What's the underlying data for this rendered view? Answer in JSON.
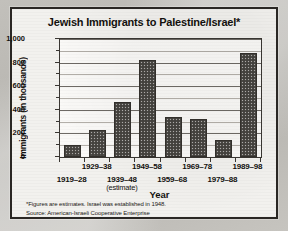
{
  "chart_data": {
    "type": "bar",
    "title": "Jewish Immigrants to Palestine/Israel*",
    "xlabel": "Year",
    "ylabel": "Immigrants (in thousands)",
    "ylim": [
      0,
      1000
    ],
    "ytick_labels": [
      "0",
      "200",
      "400",
      "600",
      "800",
      "1,000"
    ],
    "ytick_values": [
      0,
      200,
      400,
      600,
      800,
      1000
    ],
    "minor_tick_values": [
      100,
      300,
      500,
      700,
      900
    ],
    "grid": true,
    "legend": "none",
    "categories": [
      "1919–28",
      "1929–38",
      "1939–48",
      "1949–58",
      "1959–68",
      "1969–78",
      "1979–88",
      "1989–98"
    ],
    "category_notes": [
      "",
      "",
      "(estimate)",
      "",
      "",
      "",
      "",
      ""
    ],
    "values": [
      100,
      225,
      470,
      820,
      340,
      325,
      145,
      880
    ],
    "bar_color": "#4e4b47",
    "series_name": "Jewish immigrants (thousands)"
  },
  "footnotes": {
    "line1": "*Figures are estimates. Israel was established in 1948.",
    "line2": "Source: American-Israeli Cooperative Enterprise"
  }
}
